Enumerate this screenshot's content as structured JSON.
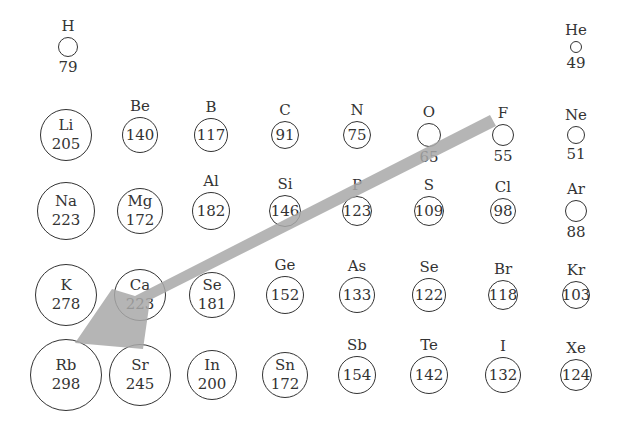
{
  "diagram": {
    "arrow": {
      "from": "F",
      "to": "Rb",
      "color": "#a8a8a8",
      "meaning": "direction of increasing atomic radius"
    },
    "elements": [
      {
        "symbol": "H",
        "radius": 79,
        "x": 68,
        "row": 0,
        "label_inside": false,
        "size": 20
      },
      {
        "symbol": "He",
        "radius": 49,
        "x": 576,
        "row": 0,
        "label_inside": false,
        "size": 12
      },
      {
        "symbol": "Li",
        "radius": 205,
        "x": 66,
        "row": 1,
        "label_inside": true,
        "both_inside": true,
        "size": 52
      },
      {
        "symbol": "Be",
        "radius": 140,
        "x": 140,
        "row": 1,
        "label_inside": true,
        "size": 36
      },
      {
        "symbol": "B",
        "radius": 117,
        "x": 211,
        "row": 1,
        "label_inside": true,
        "size": 34
      },
      {
        "symbol": "C",
        "radius": 91,
        "x": 285,
        "row": 1,
        "label_inside": true,
        "size": 28
      },
      {
        "symbol": "N",
        "radius": 75,
        "x": 357,
        "row": 1,
        "label_inside": true,
        "size": 28
      },
      {
        "symbol": "O",
        "radius": 65,
        "x": 429,
        "row": 1,
        "label_inside": false,
        "size": 24
      },
      {
        "symbol": "F",
        "radius": 55,
        "x": 503,
        "row": 1,
        "label_inside": false,
        "size": 22
      },
      {
        "symbol": "Ne",
        "radius": 51,
        "x": 576,
        "row": 1,
        "label_inside": false,
        "size": 18
      },
      {
        "symbol": "Na",
        "radius": 223,
        "x": 66,
        "row": 2,
        "label_inside": true,
        "both_inside": true,
        "size": 58
      },
      {
        "symbol": "Mg",
        "radius": 172,
        "x": 140,
        "row": 2,
        "label_inside": true,
        "both_inside": true,
        "size": 46
      },
      {
        "symbol": "Al",
        "radius": 182,
        "x": 211,
        "row": 2,
        "label_inside": true,
        "size": 38
      },
      {
        "symbol": "Si",
        "radius": 146,
        "x": 285,
        "row": 2,
        "label_inside": true,
        "size": 32
      },
      {
        "symbol": "P",
        "radius": 123,
        "x": 357,
        "row": 2,
        "label_inside": true,
        "size": 30
      },
      {
        "symbol": "S",
        "radius": 109,
        "x": 429,
        "row": 2,
        "label_inside": true,
        "size": 30
      },
      {
        "symbol": "Cl",
        "radius": 98,
        "x": 503,
        "row": 2,
        "label_inside": true,
        "size": 26
      },
      {
        "symbol": "Ar",
        "radius": 88,
        "x": 576,
        "row": 2,
        "label_inside": false,
        "size": 22
      },
      {
        "symbol": "K",
        "radius": 278,
        "x": 66,
        "row": 3,
        "label_inside": true,
        "both_inside": true,
        "size": 62
      },
      {
        "symbol": "Ca",
        "radius": 223,
        "x": 140,
        "row": 3,
        "label_inside": true,
        "both_inside": true,
        "size": 52
      },
      {
        "symbol": "Se",
        "radius": 181,
        "x": 212,
        "row": 3,
        "label_inside": true,
        "both_inside": true,
        "size": 46,
        "note": "labeled Se in source (likely Sc)"
      },
      {
        "symbol": "Ge",
        "radius": 152,
        "x": 285,
        "row": 3,
        "label_inside": true,
        "size": 38
      },
      {
        "symbol": "As",
        "radius": 133,
        "x": 357,
        "row": 3,
        "label_inside": true,
        "size": 36
      },
      {
        "symbol": "Se",
        "radius": 122,
        "x": 429,
        "row": 3,
        "label_inside": true,
        "size": 34
      },
      {
        "symbol": "Br",
        "radius": 118,
        "x": 503,
        "row": 3,
        "label_inside": true,
        "size": 30
      },
      {
        "symbol": "Kr",
        "radius": 103,
        "x": 576,
        "row": 3,
        "label_inside": true,
        "size": 28
      },
      {
        "symbol": "Rb",
        "radius": 298,
        "x": 66,
        "row": 4,
        "label_inside": true,
        "both_inside": true,
        "size": 72
      },
      {
        "symbol": "Sr",
        "radius": 245,
        "x": 140,
        "row": 4,
        "label_inside": true,
        "both_inside": true,
        "size": 62
      },
      {
        "symbol": "In",
        "radius": 200,
        "x": 212,
        "row": 4,
        "label_inside": true,
        "both_inside": true,
        "size": 50
      },
      {
        "symbol": "Sn",
        "radius": 172,
        "x": 285,
        "row": 4,
        "label_inside": true,
        "both_inside": true,
        "size": 46
      },
      {
        "symbol": "Sb",
        "radius": 154,
        "x": 357,
        "row": 4,
        "label_inside": true,
        "size": 38
      },
      {
        "symbol": "Te",
        "radius": 142,
        "x": 429,
        "row": 4,
        "label_inside": true,
        "size": 38
      },
      {
        "symbol": "I",
        "radius": 132,
        "x": 503,
        "row": 4,
        "label_inside": true,
        "size": 36
      },
      {
        "symbol": "Xe",
        "radius": 124,
        "x": 576,
        "row": 4,
        "label_inside": true,
        "size": 32
      }
    ]
  }
}
